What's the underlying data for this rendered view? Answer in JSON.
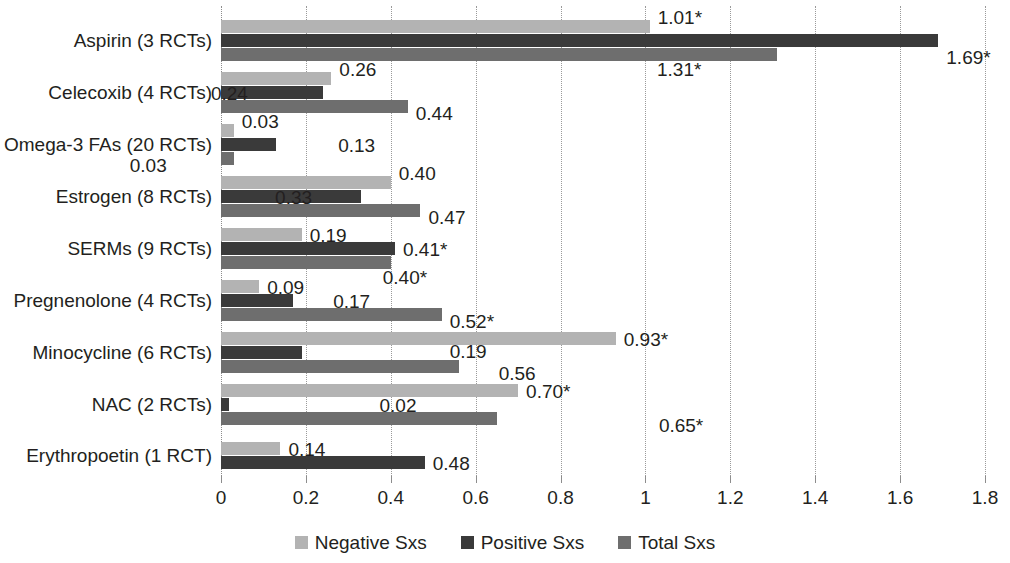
{
  "chart_data": {
    "type": "bar",
    "orientation": "horizontal",
    "title": "",
    "subtitle": "",
    "xlabel": "",
    "ylabel": "",
    "xlim": [
      0,
      1.8
    ],
    "xticks": [
      "0",
      "0.2",
      "0.4",
      "0.6",
      "0.8",
      "1",
      "1.2",
      "1.4",
      "1.6",
      "1.8"
    ],
    "xtick_values": [
      0,
      0.2,
      0.4,
      0.6,
      0.8,
      1.0,
      1.2,
      1.4,
      1.6,
      1.8
    ],
    "grid": true,
    "grid_style": "dotted-vertical",
    "legend_position": "bottom-center",
    "categories": [
      "Aspirin (3 RCTs)",
      "Celecoxib (4 RCTs)",
      "Omega-3 FAs (20 RCTs)",
      "Estrogen (8 RCTs)",
      "SERMs (9 RCTs)",
      "Pregnenolone (4 RCTs)",
      "Minocycline (6 RCTs)",
      "NAC (2 RCTs)",
      "Erythropoetin (1 RCT)"
    ],
    "series": [
      {
        "name": "Negative Sxs",
        "color": "#b3b3b3",
        "values": [
          1.01,
          0.26,
          0.03,
          0.4,
          0.19,
          0.09,
          0.93,
          0.7,
          0.14
        ],
        "labels": [
          "1.01*",
          "0.26",
          "0.03",
          "0.40",
          "0.19",
          "0.09",
          "0.93*",
          "0.70*",
          "0.14"
        ]
      },
      {
        "name": "Positive Sxs",
        "color": "#3a3a3a",
        "values": [
          1.69,
          0.24,
          0.13,
          0.33,
          0.41,
          0.17,
          0.19,
          0.02,
          0.48
        ],
        "labels": [
          "1.69*",
          "0.24",
          "0.13",
          "0.33",
          "0.41*",
          "0.17",
          "0.19",
          "0.02",
          "0.48"
        ]
      },
      {
        "name": "Total Sxs",
        "color": "#6e6e6e",
        "values": [
          1.31,
          0.44,
          0.03,
          0.47,
          0.4,
          0.52,
          0.56,
          0.65,
          null
        ],
        "labels": [
          "1.31*",
          "0.44",
          "0.03",
          "0.47",
          "0.40*",
          "0.52*",
          "0.56",
          "0.65*",
          ""
        ]
      }
    ],
    "significance_marker": "*"
  },
  "legend": {
    "items": [
      {
        "label": "Negative Sxs",
        "color": "#b3b3b3"
      },
      {
        "label": "Positive Sxs",
        "color": "#3a3a3a"
      },
      {
        "label": "Total Sxs",
        "color": "#6e6e6e"
      }
    ]
  },
  "axis": {
    "x_tick_labels": [
      "0",
      "0.2",
      "0.4",
      "0.6",
      "0.8",
      "1",
      "1.2",
      "1.4",
      "1.6",
      "1.8"
    ],
    "y_tick_labels": [
      "Aspirin (3 RCTs)",
      "Celecoxib (4 RCTs)",
      "Omega-3 FAs (20 RCTs)",
      "Estrogen (8 RCTs)",
      "SERMs (9 RCTs)",
      "Pregnenolone (4 RCTs)",
      "Minocycline (6 RCTs)",
      "NAC (2 RCTs)",
      "Erythropoetin (1 RCT)"
    ]
  },
  "value_label_offsets": {
    "note": "rendered positions of each data label relative to its bar end"
  }
}
